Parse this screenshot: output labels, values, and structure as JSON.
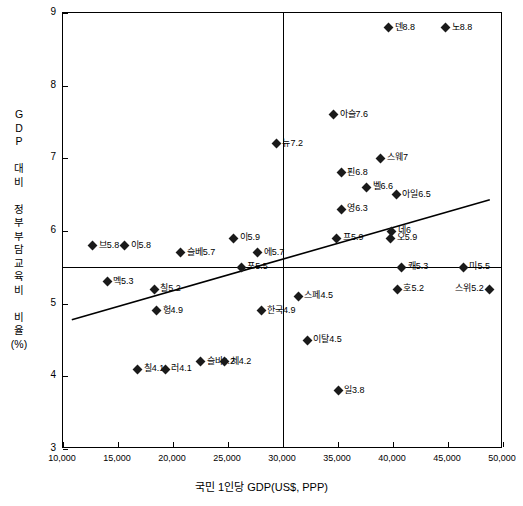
{
  "chart_data": {
    "type": "scatter",
    "title": "",
    "xlabel": "국민 1인당 GDP(US$, PPP)",
    "ylabel": "GDP 대비 정부부담교육비 비율(%)",
    "xlim": [
      10000,
      50000
    ],
    "ylim": [
      3,
      9
    ],
    "xticks": [
      "10,000",
      "15,000",
      "20,000",
      "25,000",
      "30,000",
      "35,000",
      "40,000",
      "45,000",
      "50,000"
    ],
    "yticks": [
      "3",
      "4",
      "5",
      "6",
      "7",
      "8",
      "9"
    ],
    "grid": "reference lines at x=30,000 and y=5.5",
    "legend": "none",
    "reference_lines": {
      "vertical_x": 30000,
      "horizontal_y": 5.5
    },
    "trendline": {
      "x1": 10800,
      "y1": 4.78,
      "x2": 48800,
      "y2": 6.43
    },
    "points": [
      {
        "label": "브5.8",
        "x": 12700,
        "y": 5.8,
        "side": "right"
      },
      {
        "label": "멕5.3",
        "x": 14000,
        "y": 5.3,
        "side": "right"
      },
      {
        "label": "이5.8",
        "x": 15600,
        "y": 5.8,
        "side": "right"
      },
      {
        "label": "칠5.2",
        "x": 18300,
        "y": 5.2,
        "side": "right"
      },
      {
        "label": "헝4.9",
        "x": 18500,
        "y": 4.9,
        "side": "right"
      },
      {
        "label": "칠4.1",
        "x": 16800,
        "y": 4.1,
        "side": "right"
      },
      {
        "label": "러4.1",
        "x": 19300,
        "y": 4.1,
        "side": "right"
      },
      {
        "label": "슬베5.7",
        "x": 20700,
        "y": 5.7,
        "side": "right"
      },
      {
        "label": "슬바4.2",
        "x": 22500,
        "y": 4.2,
        "side": "right"
      },
      {
        "label": "체4.2",
        "x": 24700,
        "y": 4.2,
        "side": "right"
      },
      {
        "label": "이5.9",
        "x": 25500,
        "y": 5.9,
        "side": "right"
      },
      {
        "label": "포5.5",
        "x": 26200,
        "y": 5.5,
        "side": "right"
      },
      {
        "label": "에5.7",
        "x": 27700,
        "y": 5.7,
        "side": "right"
      },
      {
        "label": "한국4.9",
        "x": 28000,
        "y": 4.9,
        "side": "right"
      },
      {
        "label": "뉴7.2",
        "x": 29400,
        "y": 7.2,
        "side": "right"
      },
      {
        "label": "스페4.5",
        "x": 31400,
        "y": 5.1,
        "side": "right"
      },
      {
        "label": "이탈4.5",
        "x": 32200,
        "y": 4.5,
        "side": "right"
      },
      {
        "label": "일3.8",
        "x": 35000,
        "y": 3.8,
        "side": "right"
      },
      {
        "label": "아슬7.6",
        "x": 34600,
        "y": 7.6,
        "side": "right"
      },
      {
        "label": "핀6.8",
        "x": 35300,
        "y": 6.8,
        "side": "right"
      },
      {
        "label": "영6.3",
        "x": 35300,
        "y": 6.3,
        "side": "right"
      },
      {
        "label": "프5.9",
        "x": 34900,
        "y": 5.9,
        "side": "right"
      },
      {
        "label": "벨6.6",
        "x": 37600,
        "y": 6.6,
        "side": "right"
      },
      {
        "label": "스웨7",
        "x": 38900,
        "y": 7.0,
        "side": "right"
      },
      {
        "label": "아일6.5",
        "x": 40300,
        "y": 6.5,
        "side": "right"
      },
      {
        "label": "네6",
        "x": 39900,
        "y": 6.0,
        "side": "right"
      },
      {
        "label": "오5.9",
        "x": 39800,
        "y": 5.9,
        "side": "right"
      },
      {
        "label": "캐5.3",
        "x": 40800,
        "y": 5.5,
        "side": "right"
      },
      {
        "label": "호5.2",
        "x": 40400,
        "y": 5.2,
        "side": "right"
      },
      {
        "label": "덴8.8",
        "x": 39600,
        "y": 8.8,
        "side": "right"
      },
      {
        "label": "노8.8",
        "x": 44800,
        "y": 8.8,
        "side": "right"
      },
      {
        "label": "미5.5",
        "x": 46400,
        "y": 5.5,
        "side": "right"
      },
      {
        "label": "스위5.2",
        "x": 48800,
        "y": 5.2,
        "side": "left"
      }
    ]
  }
}
